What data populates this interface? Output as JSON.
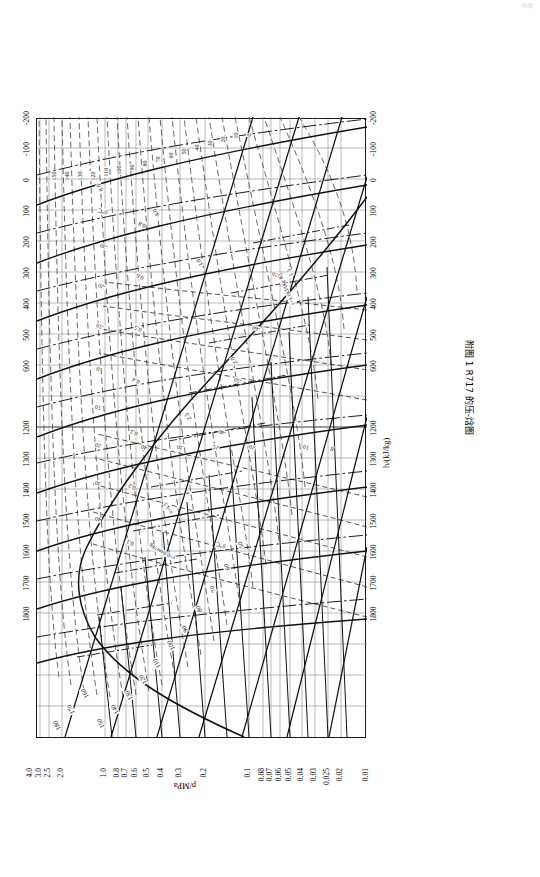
{
  "page": {
    "faint_header": "附图",
    "caption": "附图 1  R717 的压-焓图"
  },
  "axes": {
    "x_title": "h/(kJ/kg)",
    "y_title": "p/MPa",
    "x_ticks_lower": [
      "-200",
      "-100",
      "0",
      "100",
      "200",
      "300",
      "400",
      "500",
      "600"
    ],
    "x_ticks_upper": [
      "1200",
      "1300",
      "1400",
      "1500",
      "1600",
      "1700",
      "1800"
    ],
    "y_ticks": [
      "0.01",
      "0.02",
      "0.025",
      "0.03",
      "0.04",
      "0.05",
      "0.06",
      "0.07",
      "0.08",
      "0.1",
      "0.2",
      "0.3",
      "0.4",
      "0.5",
      "0.6",
      "0.7",
      "0.8",
      "1.0",
      "2.0",
      "2.5",
      "3.0",
      "4.0"
    ]
  },
  "legend_notes": {
    "v_note": "v=0.04m³/kg",
    "s_note": "s=1.0kJ/(kg·K)",
    "s45": "s=4.5",
    "zero_c": "0℃"
  },
  "chart_data": {
    "type": "line",
    "title": "附图 1  R717 的压-焓图",
    "xlabel": "h/(kJ/kg)",
    "ylabel": "p/MPa",
    "xlim": [
      -200,
      1800
    ],
    "ylim": [
      0.01,
      4.0
    ],
    "yscale": "log",
    "grid": true,
    "legend": "none",
    "families": [
      {
        "name": "isotherms",
        "unit": "℃",
        "style": "dashed-superheat / solid-saturation",
        "values": [
          180,
          170,
          160,
          150,
          140,
          130,
          120,
          110,
          100,
          90,
          80,
          70,
          60,
          50,
          40,
          30,
          20,
          10,
          0,
          -10,
          -20,
          -30,
          -40,
          -50,
          -60,
          -70
        ]
      },
      {
        "name": "isentropes",
        "unit": "kJ/(kg·K)",
        "style": "solid",
        "values": [
          1.0,
          1.5,
          2.0,
          2.5,
          3.0,
          4.0,
          4.5,
          5.0,
          6.0,
          7.0,
          8.0
        ]
      },
      {
        "name": "isochores",
        "unit": "m³/kg",
        "style": "dash-dot",
        "values": [
          0.04,
          0.1,
          0.2,
          0.3,
          0.4,
          0.5,
          0.6,
          0.7,
          0.8,
          1.0,
          1.5,
          2.0,
          2.5,
          3.0,
          4.0,
          5.0,
          6.0,
          7.0,
          8.0,
          10,
          20,
          25,
          30,
          40
        ]
      },
      {
        "name": "quality",
        "unit": "-",
        "style": "dashed",
        "values": [
          0.1,
          0.2,
          0.3,
          0.4,
          0.5,
          0.6,
          0.7,
          0.8,
          0.9
        ]
      }
    ],
    "inline_labels_isotherm_top": [
      "180",
      "170",
      "160",
      "150",
      "140",
      "130",
      "120",
      "110",
      "100",
      "90",
      "80",
      "70",
      "60",
      "50"
    ],
    "inline_labels_isotherm_right": [
      "150",
      "140",
      "130",
      "120",
      "110",
      "100",
      "90",
      "80",
      "70",
      "60",
      "50",
      "40",
      "30",
      "20",
      "10",
      "0",
      "-10",
      "-20",
      "-30",
      "-40",
      "-50",
      "-60",
      "-70"
    ],
    "inline_labels_isochore": [
      "40",
      "30",
      "25",
      "20",
      "10",
      "8",
      "7",
      "6",
      "5",
      "4",
      "3",
      "2",
      "1",
      "0.8",
      "0.7",
      "0.6",
      "0.5",
      "0.4",
      "0.3",
      "0.25",
      "0.2",
      "0.1"
    ],
    "inline_labels_isentrope": [
      "0.5",
      "1.0",
      "1.5",
      "2.0",
      "2.5",
      "3.0",
      "4.0",
      "5.0",
      "6.0",
      "7.0",
      "8.0"
    ],
    "inline_labels_quality": [
      "0.1",
      "0.2",
      "0.3",
      "0.4",
      "0.5",
      "0.6",
      "0.8"
    ]
  }
}
